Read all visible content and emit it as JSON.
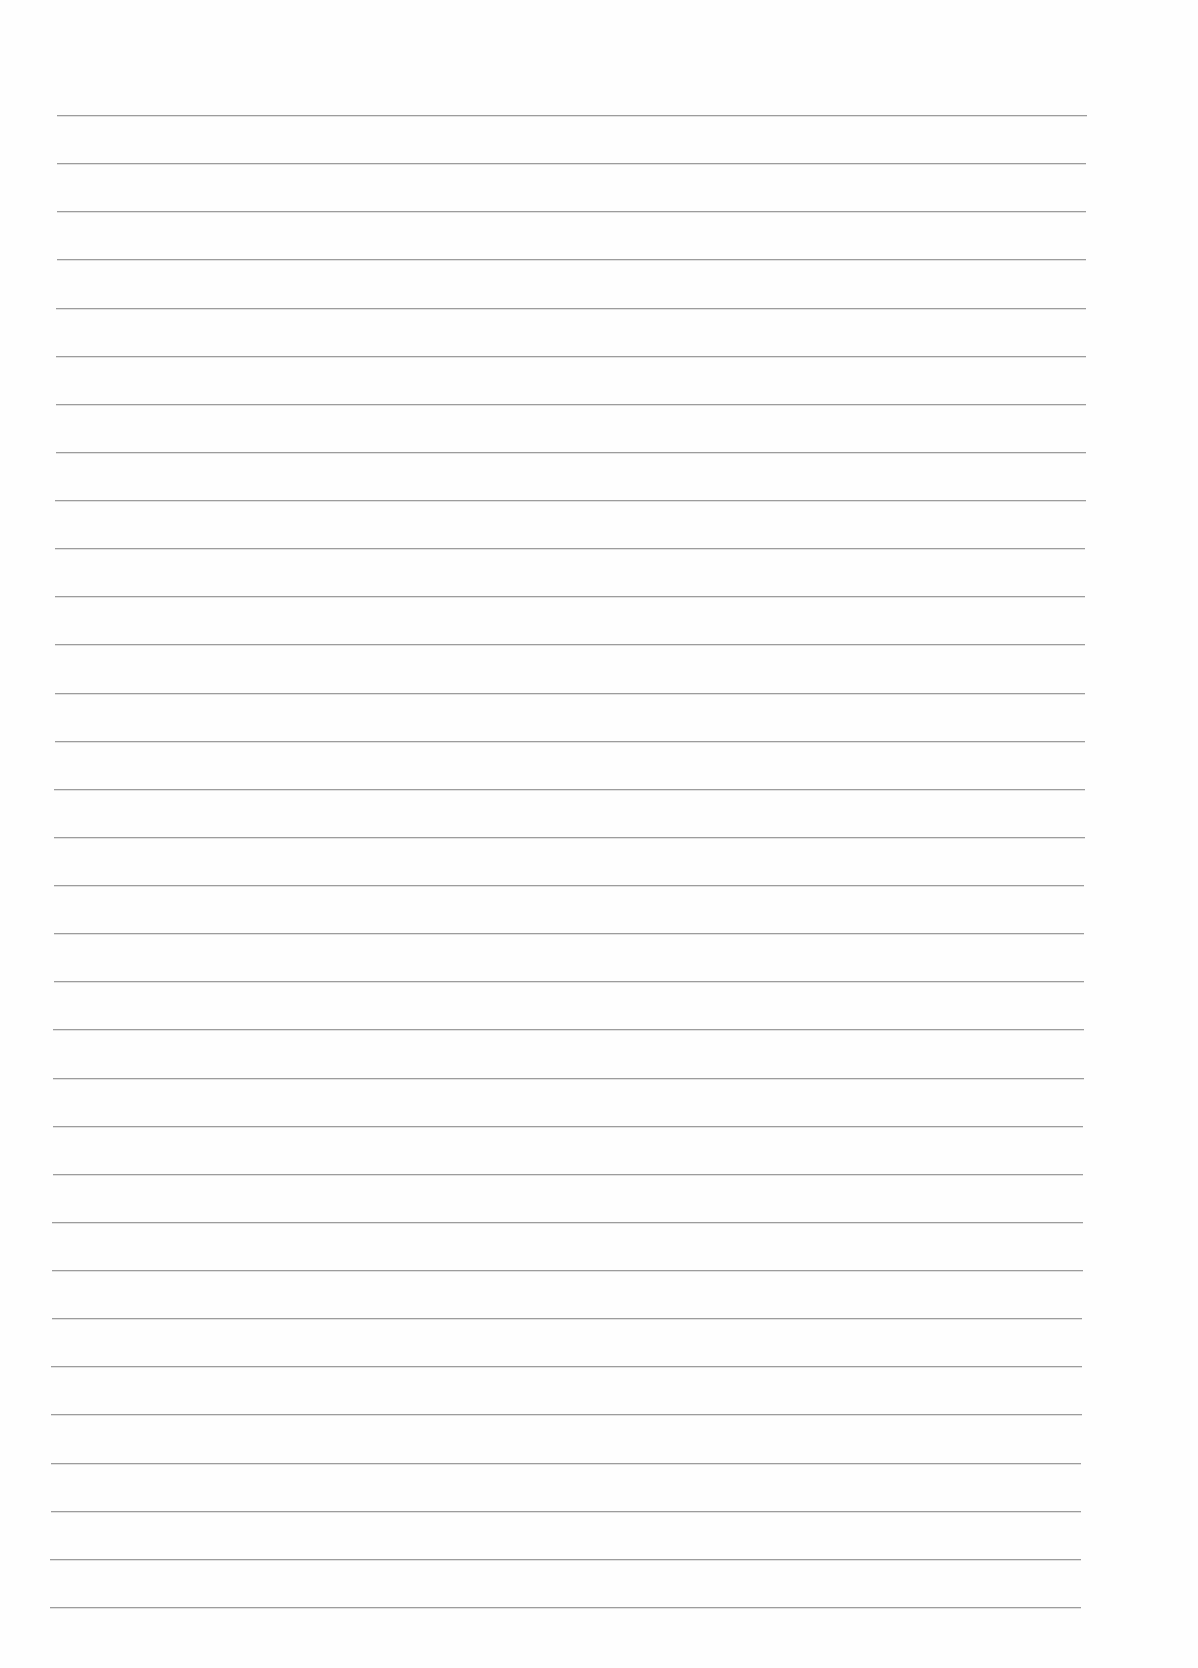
{
  "page": {
    "type": "blank-lined-paper",
    "background_color": "#fefefe",
    "line_color": "#9c9c9c",
    "line_count": 32
  },
  "lines": [
    {
      "y": 115,
      "x1": 57,
      "x2": 1087
    },
    {
      "y": 165,
      "x1": 57,
      "x2": 1086
    },
    {
      "y": 214,
      "x1": 57,
      "x2": 1086
    },
    {
      "y": 262,
      "x1": 57,
      "x2": 1086
    },
    {
      "y": 311,
      "x1": 56,
      "x2": 1086
    },
    {
      "y": 360,
      "x1": 56,
      "x2": 1086
    },
    {
      "y": 409,
      "x1": 56,
      "x2": 1086
    },
    {
      "y": 458,
      "x1": 56,
      "x2": 1086
    },
    {
      "y": 507,
      "x1": 55,
      "x2": 1086
    },
    {
      "y": 556,
      "x1": 55,
      "x2": 1085
    },
    {
      "y": 605,
      "x1": 55,
      "x2": 1085
    },
    {
      "y": 654,
      "x1": 55,
      "x2": 1085
    },
    {
      "y": 703,
      "x1": 55,
      "x2": 1085
    },
    {
      "y": 752,
      "x1": 55,
      "x2": 1085
    },
    {
      "y": 801,
      "x1": 54,
      "x2": 1085
    },
    {
      "y": 851,
      "x1": 54,
      "x2": 1085
    },
    {
      "y": 900,
      "x1": 54,
      "x2": 1084
    },
    {
      "y": 950,
      "x1": 54,
      "x2": 1084
    },
    {
      "y": 999,
      "x1": 54,
      "x2": 1084
    },
    {
      "y": 1049,
      "x1": 53,
      "x2": 1084
    },
    {
      "y": 1098,
      "x1": 53,
      "x2": 1084
    },
    {
      "y": 1147,
      "x1": 53,
      "x2": 1083
    },
    {
      "y": 1196,
      "x1": 53,
      "x2": 1083
    },
    {
      "y": 1245,
      "x1": 52,
      "x2": 1083
    },
    {
      "y": 1294,
      "x1": 52,
      "x2": 1083
    },
    {
      "y": 1343,
      "x1": 52,
      "x2": 1082
    },
    {
      "y": 1392,
      "x1": 51,
      "x2": 1082
    },
    {
      "y": 1441,
      "x1": 51,
      "x2": 1082
    },
    {
      "y": 1490,
      "x1": 51,
      "x2": 1081
    },
    {
      "y": 1507,
      "x1": 51,
      "x2": 1081
    },
    {
      "y": 1557,
      "x1": 50,
      "x2": 1081
    },
    {
      "y": 1607,
      "x1": 50,
      "x2": 1081
    }
  ]
}
